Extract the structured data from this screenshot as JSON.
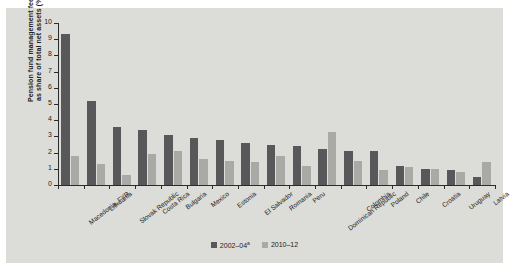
{
  "colors": {
    "panel_background": "#dcdcd8",
    "series_1": "#58585a",
    "series_2": "#a9a9a6",
    "axis": "#2b2b2b",
    "text": "#1d1d1d"
  },
  "axis_title": {
    "line1": "Pension fund management fees",
    "line2": "as share of total net assets (%)"
  },
  "legend": {
    "position": "bottom-center",
    "items": [
      {
        "label": "2002–04",
        "marker": "a",
        "color": "#58585a",
        "swatch_name": "legend-swatch-2002-04"
      },
      {
        "label": "2010–12",
        "marker": "",
        "color": "#a9a9a6",
        "swatch_name": "legend-swatch-2010-12"
      }
    ]
  },
  "chart_data": {
    "type": "bar",
    "title": "",
    "subtitle": "",
    "xlabel": "",
    "ylabel": "Pension fund management fees as share of total net assets (%)",
    "ylim": [
      0,
      10
    ],
    "yticks": [
      0,
      1,
      2,
      3,
      4,
      5,
      6,
      7,
      8,
      9,
      10
    ],
    "ytick_labels": [
      "0",
      "1",
      "2",
      "3",
      "4",
      "5",
      "6",
      "7",
      "8",
      "9",
      "10"
    ],
    "grid": false,
    "legend_position": "bottom",
    "categories": [
      "Macedonia, FYR",
      "Lithuania",
      "Slovak Republic",
      "Costa Rica",
      "Bulgaria",
      "Mexico",
      "Estonia",
      "El Salvador",
      "Romania",
      "Peru",
      "Dominican Republic",
      "Colombia",
      "Poland",
      "Chile",
      "Croatia",
      "Uruguay",
      "Latvia"
    ],
    "series": [
      {
        "name": "2002–04",
        "color": "#58585a",
        "values": [
          9.3,
          5.2,
          3.6,
          3.4,
          3.1,
          2.9,
          2.8,
          2.6,
          2.5,
          2.4,
          2.2,
          2.1,
          2.1,
          1.2,
          1.0,
          0.9,
          0.5
        ]
      },
      {
        "name": "2010–12",
        "color": "#a9a9a6",
        "values": [
          1.8,
          1.3,
          0.6,
          1.9,
          2.1,
          1.6,
          1.5,
          1.4,
          1.8,
          1.2,
          3.3,
          1.5,
          0.9,
          1.1,
          1.0,
          0.8,
          1.4
        ]
      }
    ]
  }
}
